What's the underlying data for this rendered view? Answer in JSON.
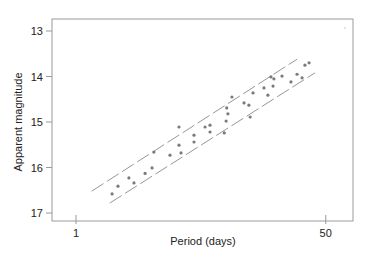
{
  "chart_data": {
    "type": "scatter",
    "title": "",
    "xlabel": "Period (days)",
    "ylabel": "Apparent magnitude",
    "xscale": "log",
    "xlim": [
      0.7,
      65
    ],
    "ylim": [
      12.75,
      17.2
    ],
    "y_inverted": true,
    "x_ticks": [
      1,
      50
    ],
    "x_tick_labels": [
      "1",
      "50"
    ],
    "y_ticks": [
      13,
      14,
      15,
      16,
      17
    ],
    "y_tick_labels": [
      "13",
      "14",
      "15",
      "16",
      "17"
    ],
    "grid": false,
    "legend": null,
    "colors": {
      "frame": "#9a9a9a",
      "points": "#7a7a7a",
      "lines": "#8a8a8a",
      "text": "#222222"
    },
    "series": [
      {
        "name": "stars",
        "kind": "scatter",
        "points": [
          [
            1.76,
            16.58
          ],
          [
            1.93,
            16.41
          ],
          [
            2.29,
            16.23
          ],
          [
            2.48,
            16.34
          ],
          [
            2.95,
            16.13
          ],
          [
            3.29,
            16.01
          ],
          [
            3.39,
            15.66
          ],
          [
            4.36,
            15.73
          ],
          [
            5.02,
            15.11
          ],
          [
            5.02,
            15.51
          ],
          [
            5.18,
            15.68
          ],
          [
            6.35,
            15.29
          ],
          [
            6.35,
            15.44
          ],
          [
            7.55,
            15.11
          ],
          [
            8.16,
            15.07
          ],
          [
            8.16,
            15.22
          ],
          [
            10.2,
            15.24
          ],
          [
            10.5,
            14.98
          ],
          [
            10.6,
            14.69
          ],
          [
            10.8,
            14.82
          ],
          [
            11.5,
            14.45
          ],
          [
            13.9,
            14.58
          ],
          [
            15.0,
            14.63
          ],
          [
            15.3,
            14.89
          ],
          [
            16.0,
            14.36
          ],
          [
            19.0,
            14.25
          ],
          [
            20.2,
            14.41
          ],
          [
            21.2,
            14.01
          ],
          [
            21.9,
            14.21
          ],
          [
            22.2,
            14.05
          ],
          [
            25.2,
            13.99
          ],
          [
            29.0,
            14.12
          ],
          [
            31.9,
            13.95
          ],
          [
            34.5,
            14.03
          ],
          [
            36.1,
            13.75
          ],
          [
            38.5,
            13.7
          ]
        ]
      },
      {
        "name": "upper-bound",
        "kind": "dashed-line",
        "points": [
          [
            1.28,
            16.52
          ],
          [
            31.9,
            13.62
          ]
        ]
      },
      {
        "name": "lower-bound",
        "kind": "dashed-line",
        "points": [
          [
            1.7,
            16.78
          ],
          [
            42.2,
            13.92
          ]
        ]
      }
    ]
  }
}
